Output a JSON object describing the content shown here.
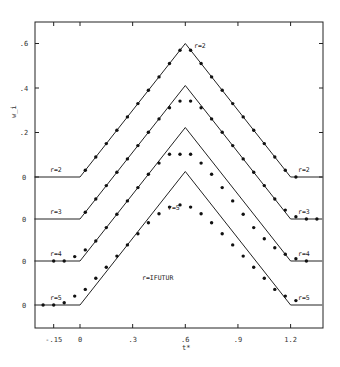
{
  "chart_data": {
    "type": "line",
    "title": "",
    "xlabel": "t*",
    "ylabel": "w_i",
    "annotation": "r=IFUTUR",
    "xlim": [
      -0.26,
      1.38
    ],
    "x_ticks": [
      -0.15,
      0,
      0.3,
      0.6,
      0.9,
      1.2
    ],
    "x_tick_labels": [
      "-.15",
      "0",
      ".3",
      ".6",
      ".9",
      "1.2"
    ],
    "y_ticks_r2": [
      0,
      0.2,
      0.4,
      0.6
    ],
    "y_tick_labels": [
      ".6",
      ".4",
      ".2",
      "0",
      "0",
      "0",
      "0"
    ],
    "grid": false,
    "legend": "inline labels at left and right of each curve",
    "exact_curve": {
      "description": "triangular heat flux: 0 for t<0, rises linearly to 0.6 at t=0.6, falls to 0 at t=1.2, 0 afterwards",
      "t": [
        -0.26,
        0,
        0.6,
        1.2,
        1.38
      ],
      "w": [
        0,
        0,
        0.6,
        0,
        0
      ]
    },
    "series": [
      {
        "name": "r=2",
        "baseline_offset_label": "0",
        "t": [
          0.03,
          0.09,
          0.15,
          0.21,
          0.27,
          0.33,
          0.39,
          0.45,
          0.51,
          0.57,
          0.63,
          0.69,
          0.75,
          0.81,
          0.87,
          0.93,
          0.99,
          1.05,
          1.11,
          1.17,
          1.23
        ],
        "w": [
          0.03,
          0.09,
          0.15,
          0.21,
          0.27,
          0.33,
          0.39,
          0.45,
          0.51,
          0.57,
          0.57,
          0.51,
          0.45,
          0.39,
          0.33,
          0.27,
          0.21,
          0.15,
          0.09,
          0.03,
          0.0
        ]
      },
      {
        "name": "r=3",
        "baseline_offset_label": "0",
        "t": [
          0.03,
          0.09,
          0.15,
          0.21,
          0.27,
          0.33,
          0.39,
          0.45,
          0.51,
          0.57,
          0.63,
          0.69,
          0.75,
          0.81,
          0.87,
          0.93,
          0.99,
          1.05,
          1.11,
          1.17,
          1.23,
          1.29,
          1.35
        ],
        "w": [
          0.03,
          0.09,
          0.15,
          0.21,
          0.27,
          0.33,
          0.39,
          0.45,
          0.5,
          0.53,
          0.53,
          0.5,
          0.45,
          0.39,
          0.33,
          0.27,
          0.21,
          0.15,
          0.09,
          0.04,
          0.01,
          0.0,
          0.0
        ]
      },
      {
        "name": "r=4",
        "baseline_offset_label": "0",
        "t": [
          -0.15,
          -0.09,
          -0.03,
          0.03,
          0.09,
          0.15,
          0.21,
          0.27,
          0.33,
          0.39,
          0.45,
          0.51,
          0.57,
          0.63,
          0.69,
          0.75,
          0.81,
          0.87,
          0.93,
          0.99,
          1.05,
          1.11,
          1.17,
          1.23,
          1.29
        ],
        "w": [
          0.0,
          0.0,
          0.02,
          0.05,
          0.09,
          0.15,
          0.21,
          0.27,
          0.33,
          0.39,
          0.44,
          0.48,
          0.48,
          0.48,
          0.44,
          0.39,
          0.33,
          0.27,
          0.21,
          0.15,
          0.1,
          0.06,
          0.03,
          0.01,
          0.0
        ]
      },
      {
        "name": "r=5",
        "baseline_offset_label": "0",
        "t": [
          -0.21,
          -0.15,
          -0.09,
          -0.03,
          0.03,
          0.09,
          0.15,
          0.21,
          0.27,
          0.33,
          0.39,
          0.45,
          0.51,
          0.57,
          0.63,
          0.69,
          0.75,
          0.81,
          0.87,
          0.93,
          0.99,
          1.05,
          1.11,
          1.17,
          1.23
        ],
        "w": [
          0.0,
          0.0,
          0.01,
          0.04,
          0.07,
          0.12,
          0.17,
          0.22,
          0.27,
          0.32,
          0.37,
          0.41,
          0.44,
          0.45,
          0.44,
          0.41,
          0.37,
          0.32,
          0.27,
          0.22,
          0.17,
          0.12,
          0.07,
          0.04,
          0.02
        ]
      }
    ]
  }
}
